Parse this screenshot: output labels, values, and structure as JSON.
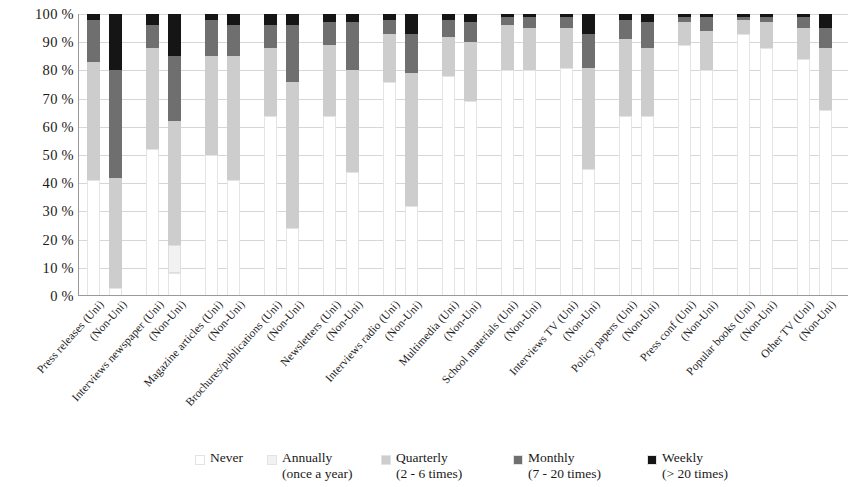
{
  "chart_data": {
    "type": "bar",
    "subtype": "stacked-percentage-column",
    "title": "",
    "xlabel": "",
    "ylabel": "",
    "ylim": [
      0,
      100
    ],
    "ytick_labels": [
      "0 %",
      "10 %",
      "20 %",
      "30 %",
      "40 %",
      "50 %",
      "60 %",
      "70 %",
      "80 %",
      "90 %",
      "100 %"
    ],
    "ytick_values": [
      0,
      10,
      20,
      30,
      40,
      50,
      60,
      70,
      80,
      90,
      100
    ],
    "grid": true,
    "legend_position": "bottom",
    "stack_order": [
      "Never",
      "Annually",
      "Quarterly",
      "Monthly",
      "Weekly"
    ],
    "series": [
      {
        "name": "Never",
        "color": "#ffffff"
      },
      {
        "name": "Annually",
        "color": "#f2f2f2"
      },
      {
        "name": "Quarterly",
        "color": "#cdcdcd"
      },
      {
        "name": "Monthly",
        "color": "#6f6f6f"
      },
      {
        "name": "Weekly",
        "color": "#151515"
      }
    ],
    "categories": [
      "Press releases (Uni)",
      "(Non-Uni)",
      "Interviews newspaper (Uni)",
      "(Non-Uni)",
      "Magazine articles (Uni)",
      "(Non-Uni)",
      "Brochures/publications (Uni)",
      "(Non-Uni)",
      "Newsletters (Uni)",
      "(Non-Uni)",
      "Interviews radio (Uni)",
      "(Non-Uni)",
      "Multimedia (Uni)",
      "(Non-Uni)",
      "School materials (Uni)",
      "(Non-Uni)",
      "Interviews TV (Uni)",
      "(Non-Uni)",
      "Policy papers (Uni)",
      "(Non-Uni)",
      "Press conf (Uni)",
      "(Non-Uni)",
      "Popular books (Uni)",
      "(Non-Uni)",
      "Other TV (Uni)",
      "(Non-Uni)"
    ],
    "bars": [
      {
        "category": "Press releases (Uni)",
        "group": "Press releases",
        "affiliation": "Uni",
        "values": {
          "Never": 41,
          "Annually": 0,
          "Quarterly": 42,
          "Monthly": 15,
          "Weekly": 2
        }
      },
      {
        "category": "Press releases (Non-Uni)",
        "group": "Press releases",
        "affiliation": "Non-Uni",
        "values": {
          "Never": 3,
          "Annually": 0,
          "Quarterly": 39,
          "Monthly": 38,
          "Weekly": 20
        }
      },
      {
        "category": "Interviews newspaper (Uni)",
        "group": "Interviews newspaper",
        "affiliation": "Uni",
        "values": {
          "Never": 52,
          "Annually": 0,
          "Quarterly": 36,
          "Monthly": 8,
          "Weekly": 4
        }
      },
      {
        "category": "Interviews newspaper (Non-Uni)",
        "group": "Interviews newspaper",
        "affiliation": "Non-Uni",
        "values": {
          "Never": 8,
          "Annually": 10,
          "Quarterly": 44,
          "Monthly": 23,
          "Weekly": 15
        }
      },
      {
        "category": "Magazine articles (Uni)",
        "group": "Magazine articles",
        "affiliation": "Uni",
        "values": {
          "Never": 50,
          "Annually": 0,
          "Quarterly": 35,
          "Monthly": 13,
          "Weekly": 2
        }
      },
      {
        "category": "Magazine articles (Non-Uni)",
        "group": "Magazine articles",
        "affiliation": "Non-Uni",
        "values": {
          "Never": 41,
          "Annually": 0,
          "Quarterly": 44,
          "Monthly": 11,
          "Weekly": 4
        }
      },
      {
        "category": "Brochures/publications (Uni)",
        "group": "Brochures/publications",
        "affiliation": "Uni",
        "values": {
          "Never": 64,
          "Annually": 0,
          "Quarterly": 24,
          "Monthly": 8,
          "Weekly": 4
        }
      },
      {
        "category": "Brochures/publications (Non-Uni)",
        "group": "Brochures/publications",
        "affiliation": "Non-Uni",
        "values": {
          "Never": 24,
          "Annually": 0,
          "Quarterly": 52,
          "Monthly": 20,
          "Weekly": 4
        }
      },
      {
        "category": "Newsletters (Uni)",
        "group": "Newsletters",
        "affiliation": "Uni",
        "values": {
          "Never": 64,
          "Annually": 0,
          "Quarterly": 25,
          "Monthly": 8,
          "Weekly": 3
        }
      },
      {
        "category": "Newsletters (Non-Uni)",
        "group": "Newsletters",
        "affiliation": "Non-Uni",
        "values": {
          "Never": 44,
          "Annually": 0,
          "Quarterly": 36,
          "Monthly": 17,
          "Weekly": 3
        }
      },
      {
        "category": "Interviews radio (Uni)",
        "group": "Interviews radio",
        "affiliation": "Uni",
        "values": {
          "Never": 76,
          "Annually": 0,
          "Quarterly": 17,
          "Monthly": 5,
          "Weekly": 2
        }
      },
      {
        "category": "Interviews radio (Non-Uni)",
        "group": "Interviews radio",
        "affiliation": "Non-Uni",
        "values": {
          "Never": 32,
          "Annually": 0,
          "Quarterly": 47,
          "Monthly": 14,
          "Weekly": 7
        }
      },
      {
        "category": "Multimedia (Uni)",
        "group": "Multimedia",
        "affiliation": "Uni",
        "values": {
          "Never": 78,
          "Annually": 0,
          "Quarterly": 14,
          "Monthly": 6,
          "Weekly": 2
        }
      },
      {
        "category": "Multimedia (Non-Uni)",
        "group": "Multimedia",
        "affiliation": "Non-Uni",
        "values": {
          "Never": 69,
          "Annually": 0,
          "Quarterly": 21,
          "Monthly": 7,
          "Weekly": 3
        }
      },
      {
        "category": "School materials (Uni)",
        "group": "School materials",
        "affiliation": "Uni",
        "values": {
          "Never": 80,
          "Annually": 0,
          "Quarterly": 16,
          "Monthly": 3,
          "Weekly": 1
        }
      },
      {
        "category": "School materials (Non-Uni)",
        "group": "School materials",
        "affiliation": "Non-Uni",
        "values": {
          "Never": 80,
          "Annually": 0,
          "Quarterly": 15,
          "Monthly": 4,
          "Weekly": 1
        }
      },
      {
        "category": "Interviews TV (Uni)",
        "group": "Interviews TV",
        "affiliation": "Uni",
        "values": {
          "Never": 81,
          "Annually": 0,
          "Quarterly": 14,
          "Monthly": 4,
          "Weekly": 1
        }
      },
      {
        "category": "Interviews TV (Non-Uni)",
        "group": "Interviews TV",
        "affiliation": "Non-Uni",
        "values": {
          "Never": 45,
          "Annually": 0,
          "Quarterly": 36,
          "Monthly": 12,
          "Weekly": 7
        }
      },
      {
        "category": "Policy papers (Uni)",
        "group": "Policy papers",
        "affiliation": "Uni",
        "values": {
          "Never": 64,
          "Annually": 0,
          "Quarterly": 27,
          "Monthly": 7,
          "Weekly": 2
        }
      },
      {
        "category": "Policy papers (Non-Uni)",
        "group": "Policy papers",
        "affiliation": "Non-Uni",
        "values": {
          "Never": 64,
          "Annually": 0,
          "Quarterly": 24,
          "Monthly": 9,
          "Weekly": 3
        }
      },
      {
        "category": "Press conf (Uni)",
        "group": "Press conf",
        "affiliation": "Uni",
        "values": {
          "Never": 89,
          "Annually": 0,
          "Quarterly": 8,
          "Monthly": 2,
          "Weekly": 1
        }
      },
      {
        "category": "Press conf (Non-Uni)",
        "group": "Press conf",
        "affiliation": "Non-Uni",
        "values": {
          "Never": 80,
          "Annually": 0,
          "Quarterly": 14,
          "Monthly": 5,
          "Weekly": 1
        }
      },
      {
        "category": "Popular books (Uni)",
        "group": "Popular books",
        "affiliation": "Uni",
        "values": {
          "Never": 93,
          "Annually": 0,
          "Quarterly": 5,
          "Monthly": 1,
          "Weekly": 1
        }
      },
      {
        "category": "Popular books (Non-Uni)",
        "group": "Popular books",
        "affiliation": "Non-Uni",
        "values": {
          "Never": 88,
          "Annually": 0,
          "Quarterly": 9,
          "Monthly": 2,
          "Weekly": 1
        }
      },
      {
        "category": "Other TV (Uni)",
        "group": "Other TV",
        "affiliation": "Uni",
        "values": {
          "Never": 84,
          "Annually": 0,
          "Quarterly": 11,
          "Monthly": 4,
          "Weekly": 1
        }
      },
      {
        "category": "Other TV (Non-Uni)",
        "group": "Other TV",
        "affiliation": "Non-Uni",
        "values": {
          "Never": 66,
          "Annually": 0,
          "Quarterly": 22,
          "Monthly": 7,
          "Weekly": 5
        }
      }
    ]
  },
  "legend": {
    "items": [
      {
        "label": "Never",
        "sublabel": "",
        "color": "#ffffff"
      },
      {
        "label": "Annually",
        "sublabel": "(once a year)",
        "color": "#f2f2f2"
      },
      {
        "label": "Quarterly",
        "sublabel": "(2 - 6 times)",
        "color": "#cdcdcd"
      },
      {
        "label": "Monthly",
        "sublabel": "(7 - 20 times)",
        "color": "#6f6f6f"
      },
      {
        "label": "Weekly",
        "sublabel": "(> 20 times)",
        "color": "#151515"
      }
    ]
  }
}
